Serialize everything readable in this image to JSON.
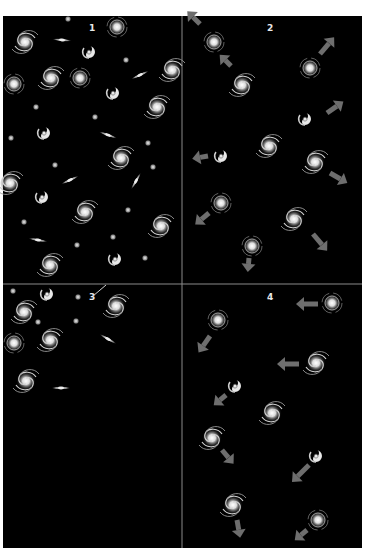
{
  "figure": {
    "background": "#000000",
    "divider_color": "#8a8a8a",
    "arrow_color": "#6e6e6e",
    "galaxy_color": "#e6e6e6",
    "panels": [
      {
        "label": "1",
        "content": "Many galaxies densely distributed across the panel"
      },
      {
        "label": "2",
        "content": "Fewer galaxies with gray arrows pointing outward, indicating motion apart"
      },
      {
        "label": "3",
        "content": "Galaxies clustered in the upper-left corner, rest of panel empty"
      },
      {
        "label": "4",
        "content": "Galaxies with gray arrows pointing left and downward"
      }
    ]
  }
}
